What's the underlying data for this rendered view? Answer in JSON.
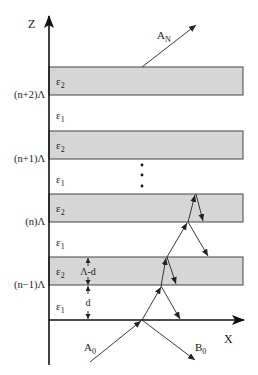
{
  "figure": {
    "axes": {
      "z_label": "Z",
      "x_label": "X"
    },
    "layers": [
      {
        "material": "ε",
        "sub": "2",
        "boundary_label": "(n+2)Λ",
        "top": 67,
        "bottom": 95
      },
      {
        "material": "ε",
        "sub": "2",
        "boundary_label": "(n+1)Λ",
        "top": 131,
        "bottom": 159
      },
      {
        "material": "ε",
        "sub": "2",
        "boundary_label": "(n)Λ",
        "top": 194,
        "bottom": 222
      },
      {
        "material": "ε",
        "sub": "2",
        "boundary_label": "(n−1)Λ",
        "top": 257,
        "bottom": 285
      }
    ],
    "gaps": [
      {
        "material": "ε",
        "sub": "1"
      },
      {
        "material": "ε",
        "sub": "1"
      },
      {
        "material": "ε",
        "sub": "1"
      },
      {
        "material": "ε",
        "sub": "1"
      }
    ],
    "dimensions": {
      "thick_layer": "Λ-d",
      "thin_layer": "d"
    },
    "waves": {
      "incident": {
        "base": "A",
        "sub": "0"
      },
      "reflected": {
        "base": "B",
        "sub": "0"
      },
      "transmitted": {
        "base": "A",
        "sub": "N"
      }
    },
    "ellipsis": "⋮",
    "colors": {
      "band_fill": "#d6d6d6",
      "line": "#222222"
    }
  }
}
